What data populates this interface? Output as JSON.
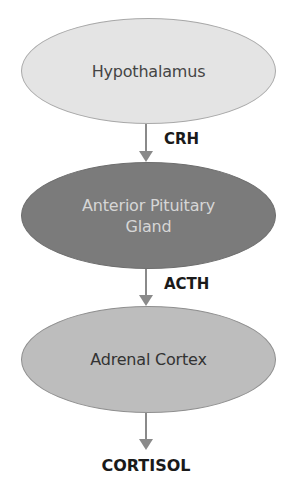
{
  "diagram": {
    "title": "",
    "nodes": [
      {
        "id": "hypothalamus",
        "label": "Hypothalamus",
        "fill": "#e4e4e4",
        "stroke": "#a8a8a8",
        "text_color": "#444444"
      },
      {
        "id": "anterior-pituitary",
        "label_line1": "Anterior Pituitary",
        "label_line2": "Gland",
        "fill": "#7b7b7b",
        "stroke": "#6e6e6e",
        "text_color": "#d6d6d6"
      },
      {
        "id": "adrenal-cortex",
        "label": "Adrenal Cortex",
        "fill": "#bdbdbd",
        "stroke": "#8f8f8f",
        "text_color": "#333333"
      }
    ],
    "edges": [
      {
        "from": "hypothalamus",
        "to": "anterior-pituitary",
        "label": "CRH"
      },
      {
        "from": "anterior-pituitary",
        "to": "adrenal-cortex",
        "label": "ACTH"
      },
      {
        "from": "adrenal-cortex",
        "to": "output",
        "label": ""
      }
    ],
    "output": {
      "label": "CORTISOL"
    },
    "arrow_color": "#8a8a8a"
  }
}
